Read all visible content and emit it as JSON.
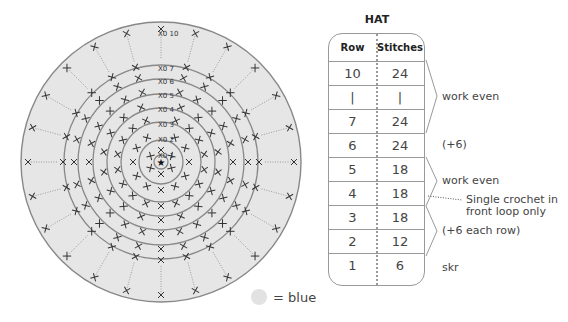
{
  "chart_title": "HAT",
  "table": {
    "headers": [
      "Row",
      "Stitches"
    ],
    "rows": [
      {
        "row": "10",
        "stitches": "24"
      },
      {
        "row": "|",
        "stitches": "|"
      },
      {
        "row": "7",
        "stitches": "24"
      },
      {
        "row": "6",
        "stitches": "24"
      },
      {
        "row": "5",
        "stitches": "18"
      },
      {
        "row": "4",
        "stitches": "18"
      },
      {
        "row": "3",
        "stitches": "18"
      },
      {
        "row": "2",
        "stitches": "12"
      },
      {
        "row": "1",
        "stitches": "6"
      }
    ]
  },
  "notes": {
    "work_even_top": "work even",
    "plus6": "(+6)",
    "work_even_mid": "work even",
    "single_crochet_line1": "Single crochet in",
    "single_crochet_line2": "front loop only",
    "plus6_each": "(+6 each row)",
    "skr": "skr"
  },
  "legend": {
    "swatch_color": "#e2e2e2",
    "label": "= blue"
  },
  "diagram": {
    "row_labels": [
      "1",
      "2",
      "3",
      "4",
      "5",
      "6",
      "7",
      "10"
    ],
    "center_symbol": "★",
    "stitch_symbol": "X",
    "fill_color": "#e6e6e6",
    "ring_color": "#888888"
  }
}
